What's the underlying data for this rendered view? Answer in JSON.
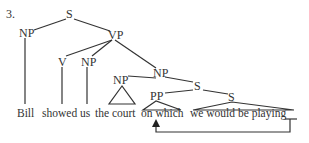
{
  "example_number": "3.",
  "nodes": {
    "root": "S",
    "subject_np": "NP",
    "vp": "VP",
    "verb": "V",
    "object_np": "NP",
    "complex_np": "NP",
    "head_np": "NP",
    "rel_s": "S",
    "pp": "PP",
    "inner_s": "S"
  },
  "words": {
    "bill": "Bill",
    "showed": "showed",
    "us": "us",
    "the_court": "the court",
    "on_which": "on which",
    "clause": "we would be playing"
  },
  "movement": {
    "from": "trace gap after 'playing'",
    "to": "on which"
  }
}
